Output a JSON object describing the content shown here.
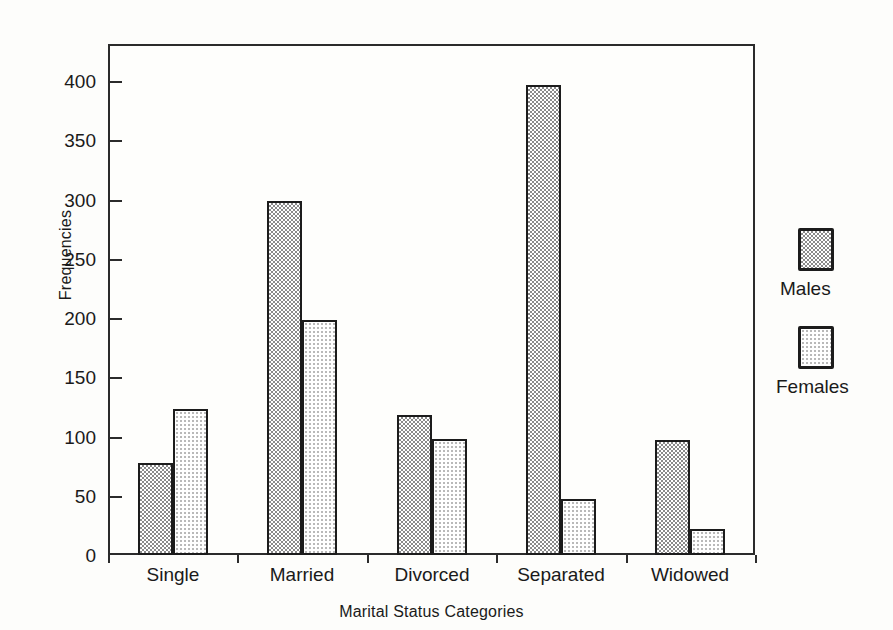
{
  "chart_data": {
    "type": "bar",
    "title": "",
    "xlabel": "Marital Status Categories",
    "ylabel": "Frequencies",
    "categories": [
      "Single",
      "Married",
      "Divorced",
      "Separated",
      "Widowed"
    ],
    "series": [
      {
        "name": "Males",
        "values": [
          78,
          299,
          118,
          397,
          97
        ]
      },
      {
        "name": "Females",
        "values": [
          123,
          198,
          98,
          47,
          22
        ]
      }
    ],
    "ylim": [
      0,
      400
    ],
    "yticks": [
      0,
      50,
      100,
      150,
      200,
      250,
      300,
      350,
      400
    ],
    "ytick_labels": [
      "0",
      "50",
      "100",
      "150",
      "200",
      "250",
      "300",
      "350",
      "400"
    ],
    "grid": false,
    "legend_position": "right",
    "legend": [
      {
        "label": "Males",
        "swatch": "dark-checker-swatch"
      },
      {
        "label": "Females",
        "swatch": "light-dot-swatch"
      }
    ],
    "colors": {
      "axis": "#2b2b2b",
      "bar_outline": "#1c1c1c",
      "males_fill": "#8a8a8a",
      "females_fill": "#b9b9b9",
      "background": "#fdfdfb"
    }
  }
}
